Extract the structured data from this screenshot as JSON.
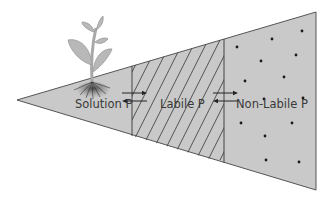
{
  "diagram": {
    "pools": [
      {
        "id": "solution",
        "label": "Solution P",
        "pattern": "plain"
      },
      {
        "id": "labile",
        "label": "Labile P",
        "pattern": "diagonal-hatch"
      },
      {
        "id": "nonlabile",
        "label": "Non-Labile P",
        "pattern": "dots"
      }
    ],
    "exchanges": [
      {
        "from": "Solution P",
        "to": "Labile P",
        "direction": "bidirectional"
      },
      {
        "from": "Labile P",
        "to": "Non-Labile P",
        "direction": "bidirectional"
      }
    ],
    "icons": [
      "plant-icon",
      "roots-icon"
    ],
    "colors": {
      "fill": "#c8c8c8",
      "stroke": "#555555",
      "plant": "#b5b5b5",
      "text": "#3a3a3a"
    }
  }
}
